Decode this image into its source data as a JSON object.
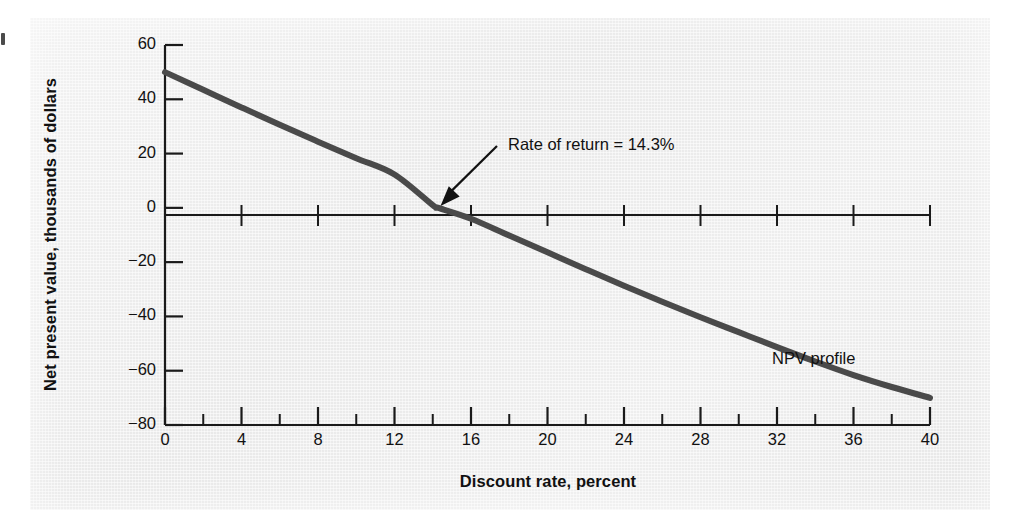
{
  "chart_data": {
    "type": "line",
    "title": "",
    "xlabel": "Discount rate, percent",
    "ylabel": "Net present value, thousands of dollars",
    "xlim": [
      0,
      40
    ],
    "ylim": [
      -80,
      60
    ],
    "grid": false,
    "legend_position": "inline",
    "x_ticks_major": [
      0,
      4,
      8,
      12,
      16,
      20,
      24,
      28,
      32,
      36,
      40
    ],
    "x_tick_labels": [
      "0",
      "4",
      "8",
      "12",
      "16",
      "20",
      "24",
      "28",
      "32",
      "36",
      "40"
    ],
    "x_ticks_minor": [
      2,
      6,
      10,
      14,
      18,
      22,
      26,
      30,
      34,
      38
    ],
    "y_ticks_major": [
      60,
      40,
      20,
      0,
      -20,
      -40,
      -60,
      -80
    ],
    "y_tick_labels": [
      "60",
      "40",
      "20",
      "0",
      "−20",
      "−40",
      "−60",
      "−80"
    ],
    "series": [
      {
        "name": "NPV profile",
        "color": "#4a4a4a",
        "x": [
          0,
          2,
          4,
          6,
          8,
          10,
          12,
          14,
          14.3,
          16,
          18,
          20,
          22,
          24,
          26,
          28,
          30,
          32,
          34,
          36,
          38,
          40
        ],
        "values": [
          50.0,
          43.5,
          37.0,
          30.6,
          24.4,
          18.3,
          12.3,
          1.0,
          0.0,
          -4.0,
          -10.2,
          -16.4,
          -22.6,
          -28.7,
          -34.6,
          -40.3,
          -45.8,
          -51.3,
          -56.6,
          -61.6,
          -66.0,
          -70.0
        ]
      }
    ],
    "annotations": [
      {
        "name": "rate-of-return",
        "text": "Rate of return = 14.3%",
        "point_x": 14.3,
        "point_y": 0
      },
      {
        "name": "series-inline-label",
        "text": "NPV profile",
        "point_x": 30.5,
        "point_y": -48
      }
    ]
  },
  "axis": {
    "y_title": "Net present value, thousands of dollars",
    "x_title": "Discount rate, percent"
  },
  "colors": {
    "curve": "#4a4a4a",
    "axis": "#1a1a1a",
    "panel_background": "#eeeeee",
    "text": "#111111"
  }
}
